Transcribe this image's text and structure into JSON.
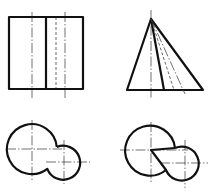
{
  "figure": {
    "views": [
      {
        "id": "front-left",
        "label": "",
        "shape": "rectangle-with-divider"
      },
      {
        "id": "front-right",
        "label": "",
        "shape": "triangle-with-internal-lines"
      },
      {
        "id": "top-left",
        "label": "",
        "shape": "two-overlapping-circles"
      },
      {
        "id": "top-right",
        "label": "",
        "shape": "two-circles-with-notch"
      }
    ],
    "colors": {
      "line": "#111111",
      "background": "#ffffff"
    }
  }
}
